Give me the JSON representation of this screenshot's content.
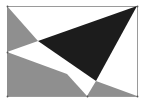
{
  "diagram": {
    "width": 146,
    "height": 105,
    "background": "#ffffff",
    "rectangle": {
      "x": 7,
      "y": 6,
      "w": 130,
      "h": 90,
      "stroke": "#9a9a9a"
    },
    "colors": {
      "black": "#1c1c1c",
      "gray": "#8f8f8f",
      "white": "#ffffff",
      "vertex": "#555555"
    },
    "regions": [
      {
        "name": "gray-top-left-triangle",
        "fill": "gray",
        "points": "7,6 7,52 38,41"
      },
      {
        "name": "black-triangle",
        "fill": "black",
        "points": "38,41 137,6 96,81"
      },
      {
        "name": "gray-bottom-left-region",
        "fill": "gray",
        "points": "7,52 7,96 87,96 67,74"
      },
      {
        "name": "gray-bottom-right-triangle",
        "fill": "gray",
        "points": "87,96 96,81 137,96"
      }
    ],
    "vertices": [
      {
        "x": 7,
        "y": 6
      },
      {
        "x": 137,
        "y": 6
      },
      {
        "x": 7,
        "y": 52
      },
      {
        "x": 7,
        "y": 96
      },
      {
        "x": 87,
        "y": 96
      },
      {
        "x": 137,
        "y": 96
      }
    ]
  }
}
